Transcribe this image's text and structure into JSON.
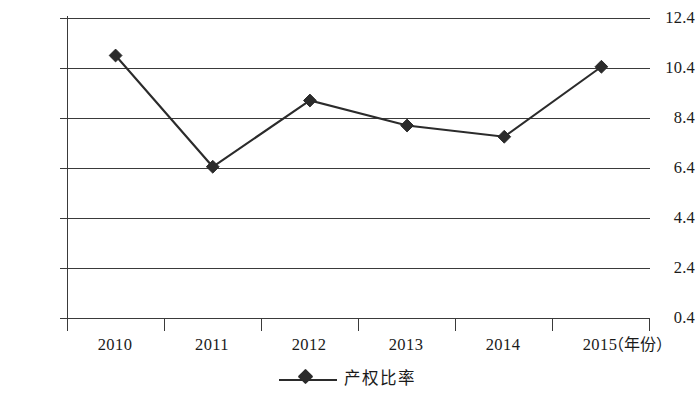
{
  "chart_data": {
    "type": "line",
    "title": "",
    "subtitle": "",
    "xlabel": "（年份）",
    "ylabel": "",
    "categories": [
      "2010",
      "2011",
      "2012",
      "2013",
      "2014",
      "2015"
    ],
    "series": [
      {
        "name": "产权比率",
        "values": [
          10.9,
          6.45,
          9.1,
          8.1,
          7.65,
          10.45
        ],
        "color": "#2b2b2b",
        "marker": "diamond"
      }
    ],
    "ylim": [
      0.4,
      12.4
    ],
    "ytick_labels": [
      "12.4",
      "10.4",
      "8.4",
      "6.4",
      "4.4",
      "2.4",
      "0.4"
    ],
    "ytick_values": [
      12.4,
      10.4,
      8.4,
      6.4,
      4.4,
      2.4,
      0.4
    ],
    "xtick_labels": [
      "2010",
      "2011",
      "2012",
      "2013",
      "2014",
      "2015"
    ],
    "grid": true,
    "grid_axis": "y",
    "legend": {
      "position": "bottom-center",
      "entries": [
        {
          "label": "产权比率",
          "marker": "diamond",
          "color": "#2b2b2b"
        }
      ]
    },
    "axis_line_color": "#3a3a3a",
    "background_color": "#ffffff"
  }
}
